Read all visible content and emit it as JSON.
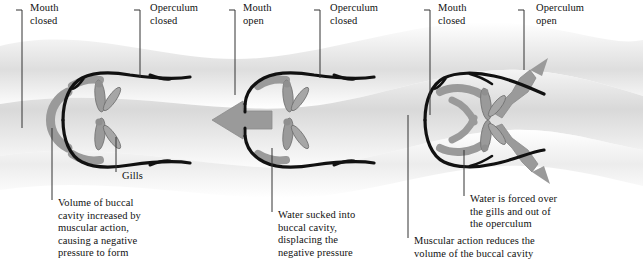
{
  "diagram": {
    "colors": {
      "outline": "#111111",
      "structure_gray": "#9a9a9a",
      "structure_gray_dark": "#7d7d7d",
      "water_band": "#d9d9d9",
      "arrow_gray": "#9a9a9a",
      "text": "#111111",
      "leader": "#333333",
      "page_background": "#ffffff"
    },
    "panels": [
      {
        "id": "panel-1",
        "stage": "1",
        "top_labels": [
          {
            "id": "mouth-closed-1",
            "text": "Mouth\nclosed",
            "x": 30,
            "y": 3,
            "leader": {
              "x1": 22,
              "y1": 10,
              "x2": 22,
              "y2": 14,
              "x3": 22,
              "y3": 128
            },
            "tick": true
          },
          {
            "id": "operculum-closed-1",
            "text": "Operculum\nclosed",
            "x": 150,
            "y": 3,
            "leader": {
              "x1": 140,
              "y1": 10,
              "x2": 140,
              "y2": 14,
              "x3": 140,
              "y3": 78
            },
            "tick": true
          }
        ],
        "bottom_labels": [
          {
            "id": "gills-1",
            "text": "Gills",
            "x": 122,
            "y": 172,
            "leader": {
              "x1": 116,
              "y1": 137,
              "x2": 116,
              "y2": 172
            }
          },
          {
            "id": "volume-buccal",
            "text": "Volume of buccal\ncavity increased by\nmuscular action,\ncausing a negative\npressure to form",
            "x": 58,
            "y": 200,
            "leader": {
              "x1": 52,
              "y1": 128,
              "x2": 52,
              "y2": 248
            }
          }
        ]
      },
      {
        "id": "panel-2",
        "stage": "2",
        "top_labels": [
          {
            "id": "mouth-open-2",
            "text": "Mouth\nopen",
            "x": 243,
            "y": 3,
            "leader": {
              "x1": 235,
              "y1": 10,
              "x2": 235,
              "y2": 14,
              "x3": 235,
              "y3": 95
            },
            "tick": true
          },
          {
            "id": "operculum-closed-2",
            "text": "Operculum\nclosed",
            "x": 330,
            "y": 3,
            "leader": {
              "x1": 320,
              "y1": 10,
              "x2": 320,
              "y2": 14,
              "x3": 320,
              "y3": 78
            },
            "tick": true
          }
        ],
        "bottom_labels": [
          {
            "id": "water-sucked",
            "text": "Water sucked into\nbuccal cavity,\ndisplacing the\nnegative pressure",
            "x": 278,
            "y": 212,
            "leader": {
              "x1": 272,
              "y1": 148,
              "x2": 272,
              "y2": 255
            }
          }
        ]
      },
      {
        "id": "panel-3",
        "stage": "3",
        "top_labels": [
          {
            "id": "mouth-closed-3",
            "text": "Mouth\nclosed",
            "x": 438,
            "y": 3,
            "leader": {
              "x1": 430,
              "y1": 10,
              "x2": 430,
              "y2": 14,
              "x3": 430,
              "y3": 115
            },
            "tick": true
          },
          {
            "id": "operculum-open-3",
            "text": "Operculum\nopen",
            "x": 536,
            "y": 3,
            "leader": {
              "x1": 524,
              "y1": 10,
              "x2": 524,
              "y2": 14,
              "x3": 524,
              "y3": 78
            },
            "tick": true
          }
        ],
        "bottom_labels": [
          {
            "id": "water-forced",
            "text": "Water is forced over\nthe gills and out of\nthe operculum",
            "x": 470,
            "y": 196,
            "leader": {
              "x1": 464,
              "y1": 150,
              "x2": 464,
              "y2": 230
            }
          },
          {
            "id": "muscular-reduces",
            "text": "Muscular action reduces the\nvolume of the buccal cavity",
            "x": 414,
            "y": 238,
            "leader": {
              "x1": 408,
              "y1": 115,
              "x2": 408,
              "y2": 258
            }
          }
        ]
      }
    ]
  }
}
